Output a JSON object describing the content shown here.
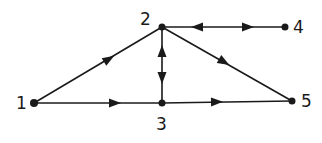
{
  "diagram": {
    "type": "directed-graph",
    "colors": {
      "ink": "#1a1a1a",
      "background": "#ffffff"
    },
    "nodes": [
      {
        "id": "1",
        "label": "1",
        "x": 34,
        "y": 103,
        "lx": 20,
        "ly": 109
      },
      {
        "id": "2",
        "label": "2",
        "x": 162,
        "y": 27,
        "lx": 142,
        "ly": 25
      },
      {
        "id": "3",
        "label": "3",
        "x": 162,
        "y": 103,
        "lx": 156,
        "ly": 129
      },
      {
        "id": "4",
        "label": "4",
        "x": 285,
        "y": 27,
        "lx": 294,
        "ly": 33
      },
      {
        "id": "5",
        "label": "5",
        "x": 292,
        "y": 101,
        "lx": 302,
        "ly": 107
      }
    ],
    "edges": [
      {
        "from": "1",
        "to": "2",
        "direction": "forward"
      },
      {
        "from": "1",
        "to": "3",
        "direction": "forward"
      },
      {
        "from": "3",
        "to": "5",
        "direction": "forward"
      },
      {
        "from": "2",
        "to": "5",
        "direction": "forward"
      },
      {
        "from": "2",
        "to": "3",
        "direction": "bidirectional"
      },
      {
        "from": "2",
        "to": "4",
        "direction": "bidirectional"
      }
    ]
  }
}
